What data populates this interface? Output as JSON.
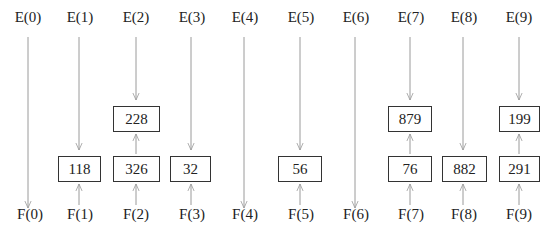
{
  "columns": [
    {
      "top": "E(0)",
      "bottom": "F(0)",
      "upper_box": null,
      "lower_box": null
    },
    {
      "top": "E(1)",
      "bottom": "F(1)",
      "upper_box": null,
      "lower_box": "118"
    },
    {
      "top": "E(2)",
      "bottom": "F(2)",
      "upper_box": "228",
      "lower_box": "326"
    },
    {
      "top": "E(3)",
      "bottom": "F(3)",
      "upper_box": null,
      "lower_box": "32"
    },
    {
      "top": "E(4)",
      "bottom": "F(4)",
      "upper_box": null,
      "lower_box": null
    },
    {
      "top": "E(5)",
      "bottom": "F(5)",
      "upper_box": null,
      "lower_box": "56"
    },
    {
      "top": "E(6)",
      "bottom": "F(6)",
      "upper_box": null,
      "lower_box": null
    },
    {
      "top": "E(7)",
      "bottom": "F(7)",
      "upper_box": "879",
      "lower_box": "76"
    },
    {
      "top": "E(8)",
      "bottom": "F(8)",
      "upper_box": null,
      "lower_box": "882"
    },
    {
      "top": "E(9)",
      "bottom": "F(9)",
      "upper_box": "199",
      "lower_box": "291"
    }
  ],
  "colors": {
    "arrow": "#9a9a9a",
    "box_border": "#333333",
    "text": "#222222"
  }
}
